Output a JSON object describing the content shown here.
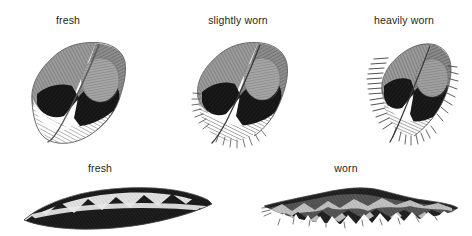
{
  "figure": {
    "background_color": "#ffffff",
    "label_color": "#231f20",
    "ink_dark": "#1a1a1a",
    "ink_black": "#0d0d0d",
    "ink_mid_gray": "#8c8c8c",
    "ink_light_gray": "#c9c9c9",
    "ink_white": "#ffffff",
    "outline_color": "#4a4a4a"
  },
  "rows": [
    {
      "name": "covert-feather-wear-series",
      "specimens": [
        {
          "id": "covert-fresh",
          "label": "fresh",
          "label_x": 68,
          "label_y": 14,
          "x": 24,
          "y": 36,
          "width": 104,
          "height": 112,
          "edge_condition": "smooth",
          "fray_amount": 0
        },
        {
          "id": "covert-slightly-worn",
          "label": "slightly worn",
          "label_x": 238,
          "label_y": 14,
          "x": 188,
          "y": 36,
          "width": 104,
          "height": 112,
          "edge_condition": "ragged",
          "fray_amount": 1
        },
        {
          "id": "covert-heavily-worn",
          "label": "heavily worn",
          "label_x": 404,
          "label_y": 14,
          "x": 366,
          "y": 36,
          "width": 92,
          "height": 112,
          "edge_condition": "heavily-frayed",
          "fray_amount": 2
        }
      ]
    },
    {
      "name": "barred-feather-wear-series",
      "specimens": [
        {
          "id": "barred-fresh",
          "label": "fresh",
          "label_x": 100,
          "label_y": 162,
          "x": 22,
          "y": 182,
          "width": 192,
          "height": 52,
          "edge_condition": "crisp-chevrons",
          "fray_amount": 0
        },
        {
          "id": "barred-worn",
          "label": "worn",
          "label_x": 346,
          "label_y": 162,
          "x": 262,
          "y": 182,
          "width": 198,
          "height": 52,
          "edge_condition": "tattered-chevrons",
          "fray_amount": 2
        }
      ]
    }
  ]
}
